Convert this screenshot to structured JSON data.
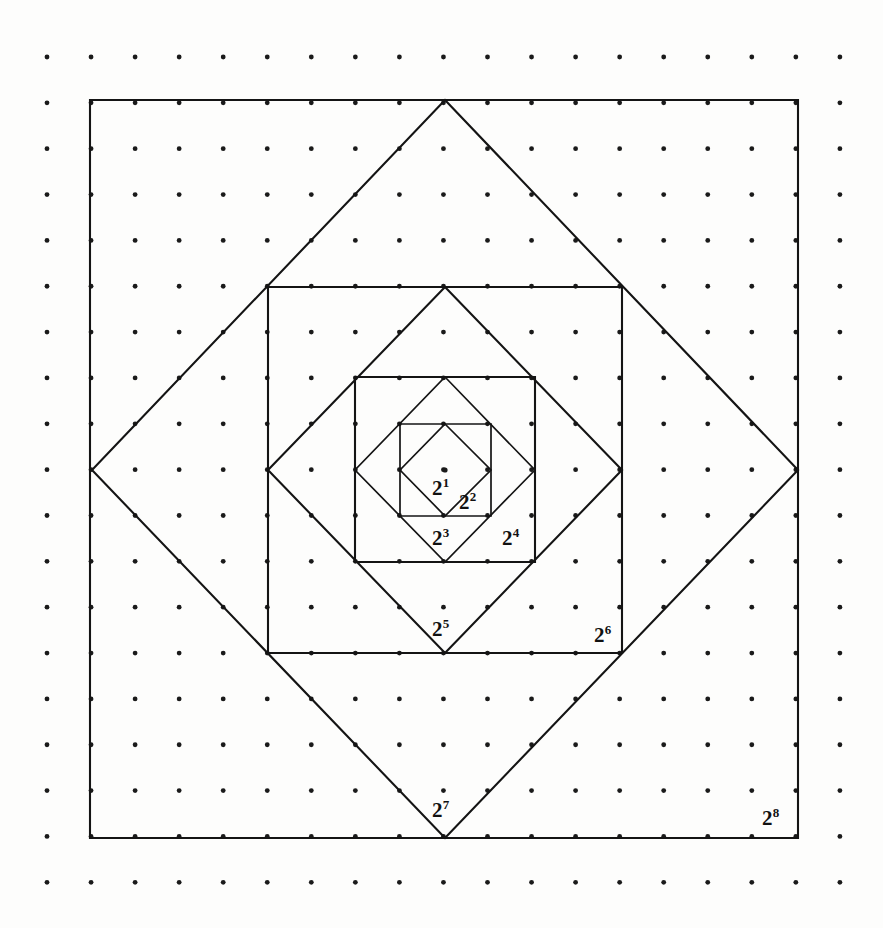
{
  "figure": {
    "background_color": "#fdfdfc",
    "stroke_color": "#141414",
    "dot_color": "#1a1a1a",
    "canvas": {
      "width": 883,
      "height": 928
    }
  },
  "grid": {
    "name": "dot-grid",
    "columns": 19,
    "rows": 19,
    "x_start": 47,
    "y_start": 57,
    "x_step": 44.05,
    "y_step": 45.85,
    "dot_radius": 2.4
  },
  "center_dot": {
    "x": 445,
    "y": 470,
    "radius": 2.6
  },
  "shapes": [
    {
      "name": "square-2-8",
      "kind": "square",
      "label": "2",
      "exponent": "8",
      "points": "90,100 798,100 798,838 90,838",
      "area_power": 8
    },
    {
      "name": "diamond-2-7",
      "kind": "diamond",
      "label": "2",
      "exponent": "7",
      "points": "445,100 798,470 445,838 92,470",
      "area_power": 7
    },
    {
      "name": "square-2-6",
      "kind": "square",
      "label": "2",
      "exponent": "6",
      "points": "268,287 622,287 622,653 268,653",
      "area_power": 6
    },
    {
      "name": "diamond-2-5",
      "kind": "diamond",
      "label": "2",
      "exponent": "5",
      "points": "445,287 622,470 445,653 268,470",
      "area_power": 5
    },
    {
      "name": "square-2-4",
      "kind": "square",
      "label": "2",
      "exponent": "4",
      "points": "355,377 535,377 535,562 355,562",
      "area_power": 4
    },
    {
      "name": "diamond-2-3",
      "kind": "diamond",
      "label": "2",
      "exponent": "3",
      "points": "445,377 535,470 445,562 355,470",
      "area_power": 3
    },
    {
      "name": "square-2-2",
      "kind": "square",
      "label": "2",
      "exponent": "2",
      "points": "400,424 491,424 491,516 400,516",
      "area_power": 2
    },
    {
      "name": "diamond-2-1",
      "kind": "diamond",
      "label": "2",
      "exponent": "1",
      "points": "445,424 491,470 445,516 400,470",
      "area_power": 1
    }
  ],
  "labels": [
    {
      "name": "label-2-1",
      "base": "2",
      "exponent": "1",
      "x": 432,
      "y": 478,
      "font_size": 21
    },
    {
      "name": "label-2-2",
      "base": "2",
      "exponent": "2",
      "x": 459,
      "y": 492,
      "font_size": 21
    },
    {
      "name": "label-2-3",
      "base": "2",
      "exponent": "3",
      "x": 432,
      "y": 528,
      "font_size": 21
    },
    {
      "name": "label-2-4",
      "base": "2",
      "exponent": "4",
      "x": 502,
      "y": 528,
      "font_size": 21
    },
    {
      "name": "label-2-5",
      "base": "2",
      "exponent": "5",
      "x": 432,
      "y": 619,
      "font_size": 21
    },
    {
      "name": "label-2-6",
      "base": "2",
      "exponent": "6",
      "x": 594,
      "y": 625,
      "font_size": 21
    },
    {
      "name": "label-2-7",
      "base": "2",
      "exponent": "7",
      "x": 432,
      "y": 800,
      "font_size": 21
    },
    {
      "name": "label-2-8",
      "base": "2",
      "exponent": "8",
      "x": 762,
      "y": 808,
      "font_size": 21
    }
  ],
  "chart_data": {
    "type": "diagram",
    "categories": [
      "2^1",
      "2^2",
      "2^3",
      "2^4",
      "2^5",
      "2^6",
      "2^7",
      "2^8"
    ],
    "values": [
      1,
      2,
      4,
      8,
      16,
      32,
      64,
      128
    ],
    "xlabel": "",
    "ylabel": "relative area",
    "grid": "dot lattice 19 x 19"
  }
}
